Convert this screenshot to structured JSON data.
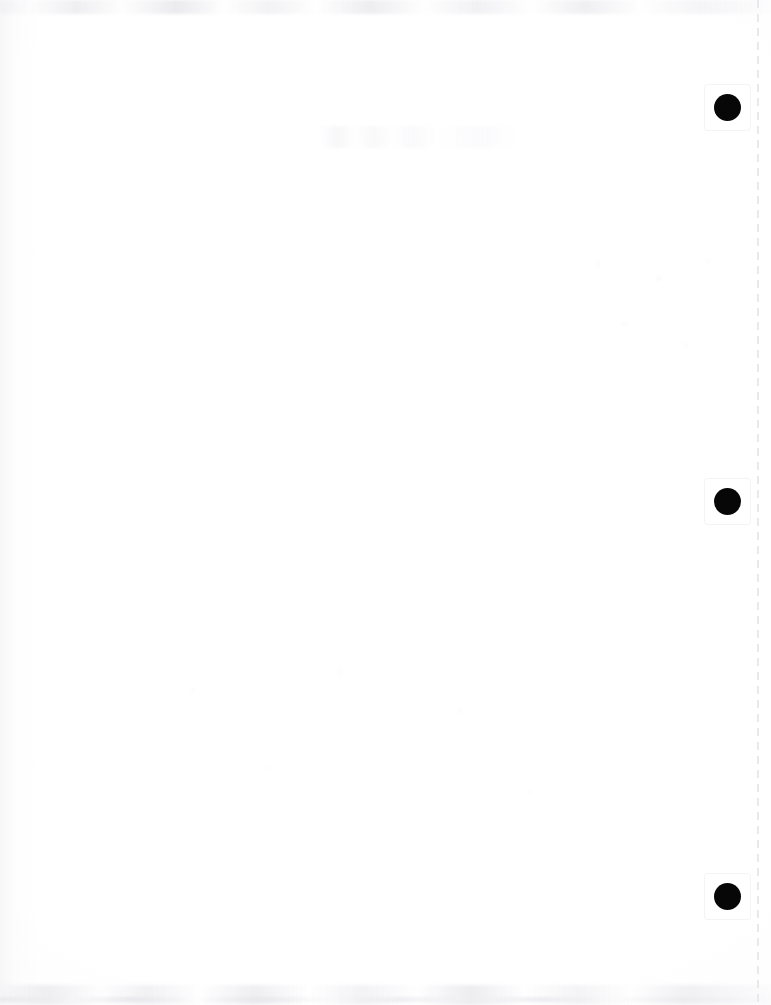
{
  "document": {
    "kind": "scanned-page",
    "page_label": "",
    "content_text": "",
    "width_px": 771,
    "height_px": 1005,
    "background_color": "#ffffff",
    "orientation": "portrait",
    "is_blank": true
  },
  "colors": {
    "paper": "#ffffff",
    "paper_edge_tint": "#f7f7f8",
    "punch_mark": "#070707",
    "perforation_dash": "#e9e9ed",
    "smudge_gray": "#e8e8ed"
  },
  "binding": {
    "punch_holes": [
      {
        "name": "punch-hole-top",
        "center_x": 727,
        "center_y": 107,
        "diameter": 27
      },
      {
        "name": "punch-hole-middle",
        "center_x": 727,
        "center_y": 501,
        "diameter": 27
      },
      {
        "name": "punch-hole-bottom",
        "center_x": 727,
        "center_y": 896,
        "diameter": 27
      }
    ],
    "hole_count": 3,
    "hole_spacing_px": 394
  },
  "perforation": {
    "name": "perforation-guide-line",
    "x": 757,
    "style": "dashed",
    "dash_length_px": 8,
    "gap_length_px": 6,
    "color": "#e9e9ed",
    "full_height": true
  },
  "scan_artifacts": {
    "top_edge_smudge": true,
    "bottom_edge_smudge": true,
    "left_edge_gradient": true,
    "ghost_bleed_through": true
  }
}
